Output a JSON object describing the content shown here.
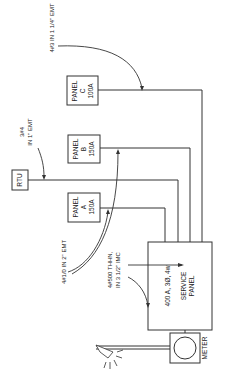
{
  "diagram": {
    "type": "electrical-single-line",
    "colors": {
      "line": "#333333",
      "background": "#ffffff"
    },
    "equipment": {
      "panel_c": {
        "line1": "PANEL",
        "line2": "C",
        "line3": "100A"
      },
      "panel_b": {
        "line1": "PANEL",
        "line2": "B",
        "line3": "150A"
      },
      "panel_a": {
        "line1": "PANEL",
        "line2": "A",
        "line3": "150A"
      },
      "rtu": {
        "label": "RTU"
      },
      "service_panel": {
        "line1": "400 A, 3Ø, 4w",
        "line2": "SERVICE",
        "line3": "PANEL"
      },
      "meter": {
        "label": "METER"
      }
    },
    "callouts": {
      "panel_c_feeder": "4#3 IN 1 1/4\" EMT",
      "rtu_feeder_line1": "3#4",
      "rtu_feeder_line2": "IN 1\" EMT",
      "panel_ab_feeder": "4#1/0 IN 2\" EMT",
      "service_feeder_line1": "4#500 THHN,",
      "service_feeder_line2": "IN 3 1/2\" IMC"
    }
  }
}
